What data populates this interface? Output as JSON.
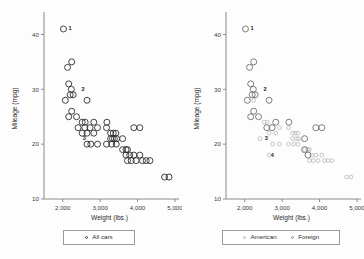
{
  "figure": {
    "background": "#fdfdfd",
    "axis_color": "#8a8a8a"
  },
  "chart_data": [
    {
      "type": "scatter",
      "panel": "left",
      "title": "",
      "xlabel": "Weight (lbs.)",
      "ylabel": "Mileage (mpg)",
      "xlim": [
        1500,
        5000
      ],
      "ylim": [
        10,
        43
      ],
      "xticks": [
        2000,
        3000,
        4000,
        5000
      ],
      "xticklabels": [
        "2,000",
        "3,000",
        "4,000",
        "5,000"
      ],
      "yticks": [
        10,
        20,
        30,
        40
      ],
      "yticklabels": [
        "10",
        "20",
        "30",
        "40"
      ],
      "grid": false,
      "legend_position": "below-center",
      "series": [
        {
          "name": "All cars",
          "marker": "open-circle",
          "color": "#2e2e2e",
          "points": [
            [
              2020,
              41
            ],
            [
              2240,
              35
            ],
            [
              2130,
              34
            ],
            [
              2160,
              31
            ],
            [
              2230,
              30
            ],
            [
              2200,
              29
            ],
            [
              2280,
              29
            ],
            [
              2070,
              28
            ],
            [
              2650,
              28
            ],
            [
              2240,
              26
            ],
            [
              2160,
              25
            ],
            [
              2370,
              25
            ],
            [
              2520,
              24
            ],
            [
              2600,
              24
            ],
            [
              2830,
              24
            ],
            [
              3180,
              24
            ],
            [
              2410,
              23
            ],
            [
              2590,
              23
            ],
            [
              2730,
              23
            ],
            [
              2930,
              23
            ],
            [
              3170,
              23
            ],
            [
              3900,
              23
            ],
            [
              4060,
              23
            ],
            [
              2520,
              22
            ],
            [
              2650,
              22
            ],
            [
              2830,
              22
            ],
            [
              3280,
              22
            ],
            [
              3350,
              22
            ],
            [
              3420,
              22
            ],
            [
              3280,
              21
            ],
            [
              3330,
              21
            ],
            [
              3380,
              21
            ],
            [
              3440,
              21
            ],
            [
              3600,
              21
            ],
            [
              2650,
              20
            ],
            [
              2750,
              20
            ],
            [
              2930,
              20
            ],
            [
              3170,
              20
            ],
            [
              3310,
              20
            ],
            [
              3430,
              20
            ],
            [
              3600,
              19
            ],
            [
              3690,
              19
            ],
            [
              3730,
              19
            ],
            [
              3690,
              18
            ],
            [
              3790,
              18
            ],
            [
              3900,
              18
            ],
            [
              4060,
              18
            ],
            [
              3730,
              17
            ],
            [
              3830,
              17
            ],
            [
              3960,
              17
            ],
            [
              4130,
              17
            ],
            [
              4230,
              17
            ],
            [
              4330,
              17
            ],
            [
              4720,
              14
            ],
            [
              4840,
              14
            ]
          ]
        }
      ],
      "annotations": [
        {
          "label": "1",
          "x": 2020,
          "y": 41
        },
        {
          "label": "2",
          "x": 2370,
          "y": 30
        },
        {
          "label": "3",
          "x": 2400,
          "y": 21
        }
      ]
    },
    {
      "type": "scatter",
      "panel": "right",
      "title": "",
      "xlabel": "Weight (lbs.)",
      "ylabel": "Mileage (mpg)",
      "xlim": [
        1500,
        5000
      ],
      "ylim": [
        10,
        43
      ],
      "xticks": [
        2000,
        3000,
        4000,
        5000
      ],
      "xticklabels": [
        "2,000",
        "3,000",
        "4,000",
        "5,000"
      ],
      "yticks": [
        10,
        20,
        30,
        40
      ],
      "yticklabels": [
        "10",
        "20",
        "30",
        "40"
      ],
      "grid": false,
      "legend_position": "below-center",
      "series": [
        {
          "name": "American",
          "marker": "small-open-circle",
          "color": "#b9b9b9",
          "points": [
            [
              2240,
              28
            ],
            [
              2520,
              24
            ],
            [
              2600,
              24
            ],
            [
              2930,
              23
            ],
            [
              3170,
              23
            ],
            [
              2650,
              22
            ],
            [
              2830,
              22
            ],
            [
              3280,
              22
            ],
            [
              2750,
              20
            ],
            [
              2930,
              20
            ],
            [
              3170,
              20
            ],
            [
              2410,
              21
            ],
            [
              3310,
              20
            ],
            [
              3430,
              20
            ],
            [
              3600,
              19
            ],
            [
              3690,
              19
            ],
            [
              3730,
              19
            ],
            [
              2650,
              18
            ],
            [
              3790,
              18
            ],
            [
              3900,
              18
            ],
            [
              4060,
              18
            ],
            [
              3730,
              17
            ],
            [
              3830,
              17
            ],
            [
              3960,
              17
            ],
            [
              4130,
              17
            ],
            [
              4230,
              17
            ],
            [
              4330,
              17
            ],
            [
              4720,
              14
            ],
            [
              4840,
              14
            ],
            [
              3350,
              22
            ],
            [
              3420,
              22
            ],
            [
              3280,
              21
            ],
            [
              3380,
              21
            ],
            [
              3440,
              21
            ]
          ]
        },
        {
          "name": "Foreign",
          "marker": "open-circle",
          "color": "#6f6f6f",
          "points": [
            [
              2020,
              41
            ],
            [
              2240,
              35
            ],
            [
              2130,
              34
            ],
            [
              2160,
              31
            ],
            [
              2230,
              30
            ],
            [
              2200,
              29
            ],
            [
              2280,
              29
            ],
            [
              2070,
              28
            ],
            [
              2160,
              25
            ],
            [
              2370,
              25
            ],
            [
              2240,
              26
            ],
            [
              2650,
              28
            ],
            [
              2830,
              24
            ],
            [
              3180,
              24
            ],
            [
              2590,
              23
            ],
            [
              2730,
              23
            ],
            [
              3900,
              23
            ],
            [
              4060,
              23
            ],
            [
              3600,
              21
            ],
            [
              3690,
              18
            ],
            [
              3600,
              19
            ]
          ]
        }
      ],
      "annotations": [
        {
          "label": "1",
          "x": 2020,
          "y": 41
        },
        {
          "label": "2",
          "x": 2370,
          "y": 30
        },
        {
          "label": "3",
          "x": 2400,
          "y": 21
        },
        {
          "label": "4",
          "x": 2560,
          "y": 18
        }
      ]
    }
  ],
  "axes": {
    "left": {
      "xlabel": "Weight (lbs.)",
      "ylabel": "Mileage (mpg)",
      "xticklabels": [
        "2,000",
        "3,000",
        "4,000",
        "5,000"
      ],
      "yticklabels": [
        "10",
        "20",
        "30",
        "40"
      ]
    },
    "right": {
      "xlabel": "Weight (lbs.)",
      "ylabel": "Mileage (mpg)",
      "xticklabels": [
        "2,000",
        "3,000",
        "4,000",
        "5,000"
      ],
      "yticklabels": [
        "10",
        "20",
        "30",
        "40"
      ]
    }
  },
  "legends": {
    "left": {
      "entries": [
        {
          "label": "All cars",
          "marker": "open-circle",
          "color": "#3a3a3a"
        }
      ]
    },
    "right": {
      "entries": [
        {
          "label": "American",
          "marker": "small-open-circle",
          "color": "#b0b0b0"
        },
        {
          "label": "Foreign",
          "marker": "open-circle",
          "color": "#8d8d8d"
        }
      ]
    }
  }
}
